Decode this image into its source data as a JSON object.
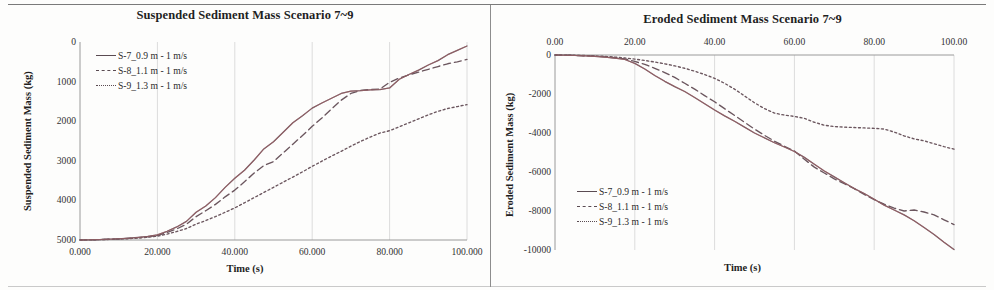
{
  "figure": {
    "panels": [
      {
        "id": "suspended",
        "title": "Suspended Sediment Mass Scenario 7~9",
        "ylabel": "Suspended Sediment Mass (kg)",
        "xlabel": "Time (s)",
        "xticks": [
          "0.000",
          "20.000",
          "40.000",
          "60.000",
          "80.000",
          "100.000"
        ],
        "yticks": [
          "5000",
          "4000",
          "3000",
          "2000",
          "1000",
          "0"
        ],
        "legend": [
          {
            "label": "S-7_0.9 m - 1 m/s",
            "style": "solid"
          },
          {
            "label": "S-8_1.1 m - 1 m/s",
            "style": "dashed"
          },
          {
            "label": "S-9_1.3 m - 1 m/s",
            "style": "dotted"
          }
        ]
      },
      {
        "id": "eroded",
        "title": "Eroded Sediment Mass Scenario 7~9",
        "ylabel": "Eroded Sediment Mass (kg)",
        "xlabel": "Time (s)",
        "xticks": [
          "0.00",
          "20.00",
          "40.00",
          "60.00",
          "80.00",
          "100.00"
        ],
        "yticks": [
          "0",
          "-2000",
          "-4000",
          "-6000",
          "-8000",
          "-10000"
        ],
        "legend": [
          {
            "label": "S-7_0.9 m - 1 m/s",
            "style": "solid"
          },
          {
            "label": "S-8_1.1 m - 1 m/s",
            "style": "dashed"
          },
          {
            "label": "S-9_1.3 m - 1 m/s",
            "style": "dotted"
          }
        ]
      }
    ]
  },
  "colors": {
    "line": "#6b565e",
    "line_highlight": "#b4656a",
    "grid": "#dcdcdc",
    "axis": "#9a9a9a",
    "text": "#2b2b2b"
  },
  "chart_data": [
    {
      "type": "line",
      "title": "Suspended Sediment Mass Scenario 7~9",
      "xlabel": "Time (s)",
      "ylabel": "Suspended Sediment Mass (kg)",
      "xlim": [
        0,
        100
      ],
      "ylim": [
        0,
        5000
      ],
      "xticks": [
        0,
        20,
        40,
        60,
        80,
        100
      ],
      "yticks": [
        0,
        1000,
        2000,
        3000,
        4000,
        5000
      ],
      "grid": "vertical",
      "legend_position": "top-left-inside",
      "x": [
        0,
        2.5,
        5,
        7.5,
        10,
        12.5,
        15,
        17.5,
        20,
        22.5,
        25,
        27.5,
        30,
        32.5,
        35,
        37.5,
        40,
        42.5,
        45,
        47.5,
        50,
        52.5,
        55,
        57.5,
        60,
        62.5,
        65,
        67.5,
        70,
        72.5,
        75,
        77.5,
        80,
        82.5,
        85,
        87.5,
        90,
        92.5,
        95,
        97.5,
        100
      ],
      "series": [
        {
          "name": "S-7_0.9 m - 1 m/s",
          "style": "solid",
          "values": [
            0,
            5,
            12,
            20,
            30,
            45,
            65,
            90,
            130,
            220,
            330,
            470,
            700,
            860,
            1070,
            1330,
            1560,
            1760,
            2020,
            2300,
            2480,
            2720,
            2960,
            3140,
            3330,
            3460,
            3580,
            3700,
            3760,
            3770,
            3790,
            3800,
            3840,
            4060,
            4180,
            4290,
            4420,
            4530,
            4680,
            4790,
            4900
          ]
        },
        {
          "name": "S-8_1.1 m - 1 m/s",
          "style": "dashed",
          "values": [
            0,
            4,
            10,
            18,
            27,
            40,
            58,
            80,
            115,
            190,
            280,
            400,
            590,
            740,
            900,
            1090,
            1260,
            1470,
            1690,
            1880,
            1980,
            2200,
            2420,
            2640,
            2870,
            3080,
            3310,
            3530,
            3700,
            3780,
            3800,
            3810,
            3980,
            4090,
            4170,
            4240,
            4310,
            4380,
            4450,
            4500,
            4560
          ]
        },
        {
          "name": "S-9_1.3 m - 1 m/s",
          "style": "dotted",
          "values": [
            0,
            3,
            8,
            14,
            22,
            33,
            48,
            68,
            98,
            150,
            215,
            290,
            400,
            490,
            590,
            700,
            810,
            940,
            1070,
            1200,
            1330,
            1460,
            1590,
            1720,
            1860,
            1990,
            2120,
            2240,
            2370,
            2490,
            2600,
            2700,
            2760,
            2860,
            2960,
            3060,
            3160,
            3250,
            3320,
            3370,
            3420
          ]
        }
      ]
    },
    {
      "type": "line",
      "title": "Eroded Sediment Mass Scenario 7~9",
      "xlabel": "Time (s)",
      "ylabel": "Eroded Sediment Mass (kg)",
      "xlim": [
        0,
        100
      ],
      "ylim": [
        -10000,
        0
      ],
      "xticks": [
        0,
        20,
        40,
        60,
        80,
        100
      ],
      "yticks": [
        0,
        -2000,
        -4000,
        -6000,
        -8000,
        -10000
      ],
      "xaxis_position": "top",
      "grid": "vertical",
      "legend_position": "bottom-left-inside",
      "x": [
        0,
        2.5,
        5,
        7.5,
        10,
        12.5,
        15,
        17.5,
        20,
        22.5,
        25,
        27.5,
        30,
        32.5,
        35,
        37.5,
        40,
        42.5,
        45,
        47.5,
        50,
        52.5,
        55,
        57.5,
        60,
        62.5,
        65,
        67.5,
        70,
        72.5,
        75,
        77.5,
        80,
        82.5,
        85,
        87.5,
        90,
        92.5,
        95,
        97.5,
        100
      ],
      "series": [
        {
          "name": "S-7_0.9 m - 1 m/s",
          "style": "solid",
          "values": [
            0,
            -10,
            -25,
            -45,
            -70,
            -110,
            -160,
            -230,
            -430,
            -720,
            -1050,
            -1350,
            -1620,
            -1870,
            -2180,
            -2500,
            -2820,
            -3120,
            -3400,
            -3700,
            -4000,
            -4250,
            -4500,
            -4720,
            -4950,
            -5250,
            -5600,
            -5950,
            -6250,
            -6550,
            -6850,
            -7100,
            -7400,
            -7700,
            -7950,
            -8200,
            -8500,
            -8850,
            -9200,
            -9600,
            -9980
          ]
        },
        {
          "name": "S-8_1.1 m - 1 m/s",
          "style": "dashed",
          "values": [
            0,
            -8,
            -20,
            -38,
            -60,
            -95,
            -140,
            -200,
            -330,
            -480,
            -680,
            -900,
            -1150,
            -1450,
            -1750,
            -2080,
            -2400,
            -2750,
            -3100,
            -3450,
            -3800,
            -4120,
            -4420,
            -4680,
            -4920,
            -5350,
            -5750,
            -6050,
            -6350,
            -6600,
            -6850,
            -7150,
            -7420,
            -7650,
            -7850,
            -8000,
            -7950,
            -8050,
            -8200,
            -8450,
            -8700
          ]
        },
        {
          "name": "S-9_1.3 m - 1 m/s",
          "style": "dotted",
          "values": [
            0,
            -6,
            -15,
            -28,
            -45,
            -70,
            -105,
            -150,
            -210,
            -280,
            -360,
            -450,
            -560,
            -680,
            -830,
            -1000,
            -1200,
            -1450,
            -1750,
            -2100,
            -2450,
            -2750,
            -2980,
            -3080,
            -3150,
            -3250,
            -3450,
            -3600,
            -3670,
            -3700,
            -3720,
            -3740,
            -3760,
            -3800,
            -3950,
            -4150,
            -4300,
            -4400,
            -4550,
            -4700,
            -4830
          ]
        }
      ]
    }
  ]
}
